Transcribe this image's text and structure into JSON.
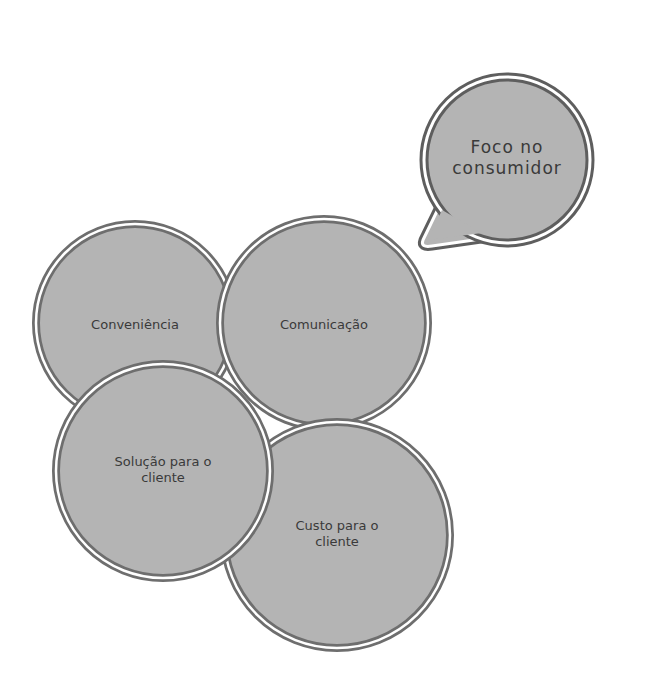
{
  "colors": {
    "fill": "#b4b4b4",
    "outer_ring": "#6e6e6e",
    "inner_ring": "#6e6e6e",
    "gap": "#ffffff",
    "text": "#3a3a3a",
    "background": "#ffffff"
  },
  "callout": {
    "shape": "speech-bubble",
    "label": "Foco no consumidor"
  },
  "circles": [
    {
      "id": "convenience",
      "label": "Conveniência"
    },
    {
      "id": "communication",
      "label": "Comunicação"
    },
    {
      "id": "customer-solution",
      "label": "Solução para o cliente"
    },
    {
      "id": "customer-cost",
      "label": "Custo para o cliente"
    }
  ]
}
